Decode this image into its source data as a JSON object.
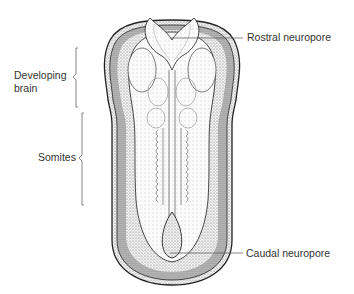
{
  "figure": {
    "labels": {
      "rostral_neuropore": "Rostral neuropore",
      "developing_brain_line1": "Developing",
      "developing_brain_line2": "brain",
      "somites": "Somites",
      "caudal_neuropore": "Caudal neuropore"
    },
    "colors": {
      "background": "#ffffff",
      "ink": "#222222",
      "stipple": "#9a9a9a",
      "leader_line": "#555555",
      "text": "#333333"
    }
  }
}
